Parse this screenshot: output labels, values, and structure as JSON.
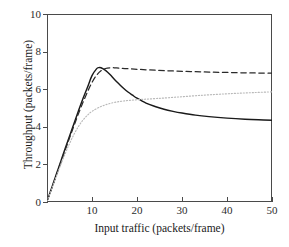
{
  "chart_data": {
    "type": "line",
    "title": "",
    "xlabel": "Input traffic (packets/frame)",
    "ylabel": "Throughput (packets/frame)",
    "xlim": [
      0,
      50
    ],
    "ylim": [
      0,
      10
    ],
    "xticks": [
      10,
      20,
      30,
      40,
      50
    ],
    "yticks": [
      0,
      2,
      4,
      6,
      8,
      10
    ],
    "grid": false,
    "legend": "none",
    "background": "#ffffff",
    "axis_color": "#4a4a4a",
    "series": [
      {
        "name": "solid-curve",
        "style": "solid",
        "color": "#1a1a1a",
        "x": [
          0,
          1,
          2,
          3,
          4,
          5,
          6,
          7,
          8,
          9,
          10,
          11,
          11.5,
          12,
          13,
          14,
          15,
          16,
          17,
          18,
          19,
          20,
          22,
          24,
          26,
          28,
          30,
          33,
          36,
          40,
          44,
          47,
          50
        ],
        "y": [
          0.05,
          0.72,
          1.42,
          2.12,
          2.82,
          3.5,
          4.18,
          4.85,
          5.5,
          6.1,
          6.72,
          7.08,
          7.15,
          7.14,
          7.0,
          6.78,
          6.52,
          6.28,
          6.05,
          5.85,
          5.68,
          5.52,
          5.26,
          5.08,
          4.93,
          4.82,
          4.73,
          4.62,
          4.54,
          4.46,
          4.4,
          4.37,
          4.35
        ]
      },
      {
        "name": "dashed-curve",
        "style": "dashed",
        "color": "#2a2a2a",
        "x": [
          0,
          1,
          2,
          3,
          4,
          5,
          6,
          7,
          8,
          9,
          10,
          11,
          12,
          13,
          14,
          15,
          16,
          18,
          20,
          24,
          28,
          32,
          36,
          40,
          44,
          47,
          50
        ],
        "y": [
          0.05,
          0.7,
          1.38,
          2.06,
          2.74,
          3.4,
          4.06,
          4.7,
          5.3,
          5.86,
          6.36,
          6.74,
          6.98,
          7.1,
          7.14,
          7.14,
          7.12,
          7.09,
          7.06,
          7.01,
          6.97,
          6.94,
          6.91,
          6.89,
          6.87,
          6.86,
          6.85
        ]
      },
      {
        "name": "dotted-curve",
        "style": "dotted",
        "color": "#b9b9b9",
        "x": [
          0,
          1,
          2,
          3,
          4,
          5,
          6,
          7,
          8,
          9,
          10,
          12,
          14,
          16,
          18,
          20,
          22,
          24,
          26,
          30,
          34,
          38,
          42,
          46,
          50
        ],
        "y": [
          0.05,
          0.68,
          1.32,
          1.95,
          2.55,
          3.1,
          3.6,
          4.02,
          4.36,
          4.62,
          4.82,
          5.08,
          5.24,
          5.34,
          5.4,
          5.44,
          5.47,
          5.5,
          5.53,
          5.6,
          5.67,
          5.73,
          5.78,
          5.82,
          5.86
        ]
      }
    ]
  },
  "axes": {
    "x_title": "Input traffic (packets/frame)",
    "y_title": "Throughput (packets/frame)",
    "x_tick_labels": [
      "10",
      "20",
      "30",
      "40",
      "50"
    ],
    "y_tick_labels": [
      "0",
      "2",
      "4",
      "6",
      "8",
      "10"
    ]
  }
}
